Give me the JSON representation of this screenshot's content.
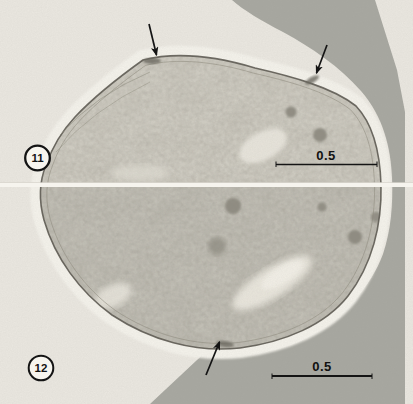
{
  "figure": {
    "panels": [
      {
        "number": "11",
        "scale_bar_label": "0.5"
      },
      {
        "number": "12",
        "scale_bar_label": "0.5"
      }
    ],
    "annotations": {
      "arrow_count": 3
    }
  },
  "colors": {
    "page_background": "#eceae3",
    "micrograph_background": "#e9e6df",
    "adjacent_cell_gray": "#a7a7a0",
    "halo_white": "#f3f1ea",
    "cell_base": "#cfccc2",
    "membrane_dark": "#5d5a52",
    "granule_gray": "#8b887e",
    "annotation_black": "#141414",
    "panel_seam": "#f6f4ee"
  }
}
